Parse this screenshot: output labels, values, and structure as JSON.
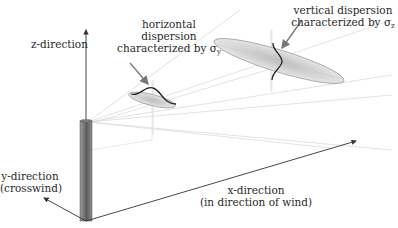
{
  "diagram": {
    "axes": {
      "z": {
        "label": "z-direction"
      },
      "y": {
        "line1": "y-direction",
        "line2": "(crosswind)"
      },
      "x": {
        "line1": "x-direction",
        "line2": "(in direction of wind)"
      }
    },
    "annotations": {
      "horizontal": {
        "line1": "horizontal",
        "line2": "dispersion",
        "line3": "characterized by σ",
        "subscript": "y"
      },
      "vertical": {
        "line1": "vertical dispersion",
        "line2": "characterized by σ",
        "subscript": "z"
      }
    },
    "elements": {
      "stack": "smokestack",
      "near_plume": "small cross-section ellipse with horizontal gaussian curve",
      "far_plume": "large cross-section ellipse with vertical gaussian curve"
    },
    "colors": {
      "line": "#333333",
      "stack_fill": "#8a8a8a",
      "stack_dark": "#5e5e5e",
      "ellipse_fill": "#d4d4d4",
      "ray": "#d8d8d8",
      "text": "#2a2a2a"
    }
  }
}
